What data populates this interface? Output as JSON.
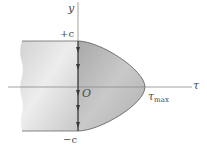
{
  "diagram": {
    "labels": {
      "y_axis": "y",
      "tau_axis": "τ",
      "top": "+c",
      "bottom": "−c",
      "origin": "O",
      "tau_max_symbol": "τ",
      "tau_max_sub": "max"
    },
    "colors": {
      "axis": "#8a8a8a",
      "outline": "#5a5a5a",
      "section_fill_light": "#e6e6e6",
      "section_fill_dark": "#c4c4c4",
      "parabola_fill": "#b9b9b9",
      "arrow": "#3a3a3a"
    },
    "geometry": {
      "y_axis_x": 78,
      "tau_axis_y": 87,
      "top_edge_y": 41,
      "bottom_edge_y": 131,
      "tau_max_x": 145,
      "arrow_y_positions": [
        50,
        67,
        93,
        108,
        125
      ]
    }
  }
}
